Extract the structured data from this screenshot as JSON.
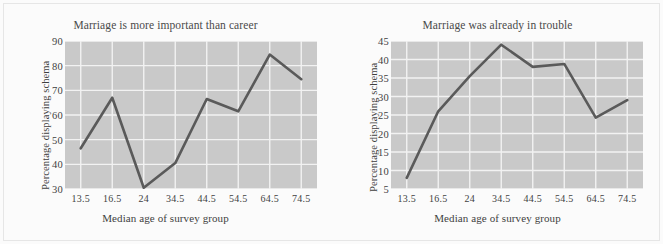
{
  "figure": {
    "background_color": "#fbfbfb",
    "plot_background_color": "#c9c9c9",
    "grid_color": "#f2f2f2",
    "line_color": "#5a5a5a"
  },
  "chart_data": [
    {
      "type": "line",
      "title": "Marriage is more important than career",
      "xlabel": "Median age of survey group",
      "ylabel": "Percentage displaying schema",
      "categories": [
        "13.5",
        "16.5",
        "24",
        "34.5",
        "44.5",
        "54.5",
        "64.5",
        "74.5"
      ],
      "values": [
        46.5,
        67,
        30.5,
        40.5,
        66.5,
        61.5,
        84.5,
        74.5
      ],
      "yticks": [
        90,
        80,
        70,
        60,
        50,
        40,
        30
      ],
      "ylim": [
        30,
        90
      ],
      "grid": true,
      "legend": "none"
    },
    {
      "type": "line",
      "title": "Marriage was already in trouble",
      "xlabel": "Median age of survey group",
      "ylabel": "Percentage displaying schema",
      "categories": [
        "13.5",
        "16.5",
        "24",
        "34.5",
        "44.5",
        "54.5",
        "64.5",
        "74.5"
      ],
      "values": [
        8,
        26,
        35.5,
        44,
        38,
        38.8,
        24.3,
        29
      ],
      "yticks": [
        45,
        40,
        35,
        30,
        25,
        20,
        15,
        10,
        5
      ],
      "ylim": [
        5,
        45
      ],
      "grid": true,
      "legend": "none"
    }
  ]
}
